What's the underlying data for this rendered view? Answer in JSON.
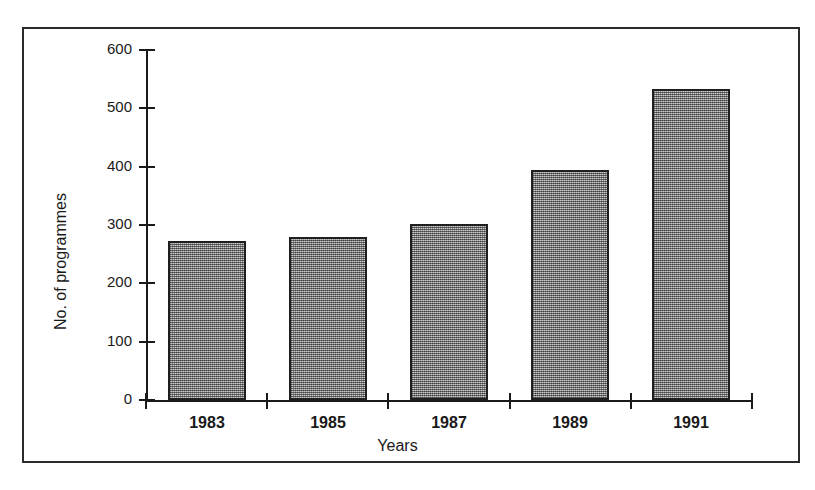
{
  "figure": {
    "frame": "thin-black-rectangle-border"
  },
  "chart_data": {
    "type": "bar",
    "title": "",
    "xlabel": "Years",
    "ylabel": "No. of programmes",
    "categories": [
      "1983",
      "1985",
      "1987",
      "1989",
      "1991"
    ],
    "values": [
      272,
      280,
      302,
      395,
      533
    ],
    "ylim": [
      0,
      600
    ],
    "yticks": [
      0,
      100,
      200,
      300,
      400,
      500,
      600
    ],
    "ytick_labels": [
      "0",
      "100",
      "200",
      "300",
      "400",
      "500",
      "600"
    ],
    "grid": false,
    "legend": false,
    "bar_fill": "#9a9a9a",
    "bar_edge": "#1f1f1f",
    "axis_color": "#1a1a1a",
    "background": "#ffffff"
  }
}
